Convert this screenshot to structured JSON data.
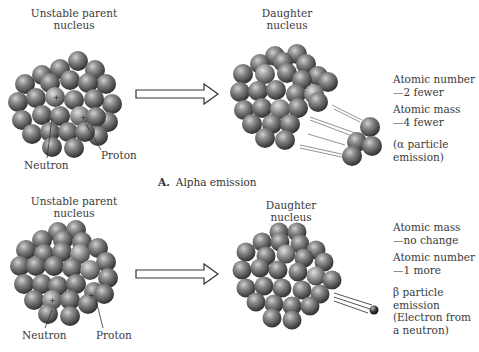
{
  "panel_a": {
    "parent_title_line1": "Unstable parent",
    "parent_title_line2": "nucleus",
    "neutron_label": "Neutron",
    "proton_label": "Proton",
    "daughter_title_line1": "Daughter",
    "daughter_title_line2": "nucleus",
    "effects": [
      {
        "line1": "Atomic number",
        "line2": "—2 fewer"
      },
      {
        "line1": "Atomic mass",
        "line2": "—4 fewer"
      }
    ],
    "particle_line1": "(α particle",
    "particle_line2": "emission)",
    "caption_letter": "A.",
    "caption_text": "Alpha emission"
  },
  "panel_b": {
    "parent_title_line1": "Unstable parent",
    "parent_title_line2": "nucleus",
    "neutron_label": "Neutron",
    "proton_label": "Proton",
    "daughter_title_line1": "Daughter",
    "daughter_title_line2": "nucleus",
    "effects": [
      {
        "line1": "Atomic mass",
        "line2": "—no change"
      },
      {
        "line1": "Atomic number",
        "line2": "—1 more"
      }
    ],
    "particle_line1": "β particle",
    "particle_line2": "emission",
    "particle_line3": "(Electron from",
    "particle_line4": "a neutron)"
  },
  "colors": {
    "sphere_light": "#c8c8c8",
    "sphere_mid": "#808080",
    "sphere_dark": "#3a3a3a",
    "arrow_stroke": "#333333"
  }
}
